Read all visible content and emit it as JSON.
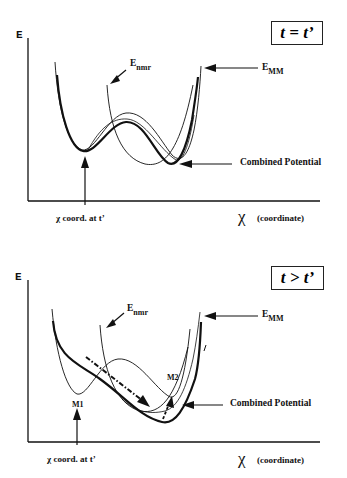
{
  "figure": {
    "panels": [
      {
        "time_label": "t = t’",
        "y_axis_label": "E",
        "x_axis_symbol": "χ",
        "x_axis_label": "(coordinate)",
        "marker_label": "χ coord. at t’",
        "curve_labels": {
          "nmr": {
            "main": "E",
            "sub": "nmr"
          },
          "mm": {
            "main": "E",
            "sub": "MM"
          },
          "combined": "Combined  Potential"
        }
      },
      {
        "time_label": "t > t’",
        "y_axis_label": "E",
        "x_axis_symbol": "χ",
        "x_axis_label": "(coordinate)",
        "marker_label": "χ coord. at t’",
        "curve_labels": {
          "nmr": {
            "main": "E",
            "sub": "nmr"
          },
          "mm": {
            "main": "E",
            "sub": "MM"
          },
          "combined": "Combined  Potential"
        },
        "minima_labels": {
          "m1": "M1",
          "m2": "M2"
        }
      }
    ],
    "colors": {
      "ink": "#111111",
      "background": "#ffffff"
    }
  }
}
